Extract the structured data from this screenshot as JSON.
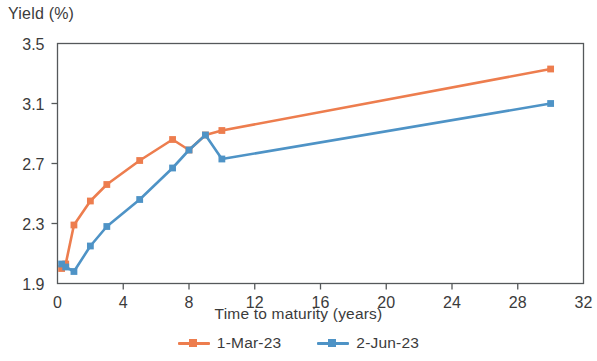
{
  "chart_data": {
    "type": "line",
    "title": "",
    "ylabel": "Yield (%)",
    "xlabel": "Time to maturity (years)",
    "xlim": [
      0,
      32
    ],
    "ylim": [
      1.9,
      3.5
    ],
    "xticks": [
      0,
      4,
      8,
      12,
      16,
      20,
      24,
      28,
      32
    ],
    "xtick_labels": [
      "0",
      "4",
      "8",
      "12",
      "16",
      "20",
      "24",
      "28",
      "32"
    ],
    "yticks": [
      1.9,
      2.3,
      2.7,
      3.1,
      3.5
    ],
    "ytick_labels": [
      "1.9",
      "2.3",
      "2.7",
      "3.1",
      "3.5"
    ],
    "grid": false,
    "legend_position": "bottom",
    "marker": "square",
    "series": [
      {
        "name": "1-Mar-23",
        "color": "#ED7D4E",
        "x": [
          0.25,
          0.5,
          1,
          2,
          3,
          5,
          7,
          8,
          9,
          10,
          30
        ],
        "values": [
          2.0,
          2.03,
          2.29,
          2.45,
          2.56,
          2.72,
          2.86,
          2.79,
          2.89,
          2.92,
          3.33
        ]
      },
      {
        "name": "2-Jun-23",
        "color": "#4E93C6",
        "x": [
          0.25,
          0.5,
          1,
          2,
          3,
          5,
          7,
          8,
          9,
          10,
          30
        ],
        "values": [
          2.03,
          2.01,
          1.98,
          2.15,
          2.28,
          2.46,
          2.67,
          2.79,
          2.89,
          2.73,
          3.1
        ]
      }
    ]
  },
  "legend": {
    "entries": [
      {
        "label": "1-Mar-23",
        "marker_name": "legend-marker-series-1"
      },
      {
        "label": "2-Jun-23",
        "marker_name": "legend-marker-series-2"
      }
    ]
  },
  "colors": {
    "series_1": "#ED7D4E",
    "series_2": "#4E93C6",
    "axis": "#55585a",
    "text": "#3b3b3b"
  }
}
